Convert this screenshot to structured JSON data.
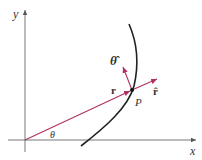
{
  "figure": {
    "labels": {
      "y_axis": "y",
      "x_axis": "x",
      "angle": "θ",
      "position_vector": "r",
      "point": "P",
      "r_hat": "r̂",
      "theta_hat": "θ̂"
    },
    "colors": {
      "axes": "#555555",
      "vector": "#b03060",
      "curve": "#222222",
      "point": "#111111"
    },
    "geometry": {
      "origin": [
        25,
        140
      ],
      "point_P": [
        132,
        90
      ],
      "r_hat_tip": [
        158,
        79
      ],
      "theta_hat_tip": [
        123,
        66
      ],
      "x_axis_end": [
        196,
        140
      ],
      "y_axis_top": [
        25,
        10
      ]
    }
  }
}
